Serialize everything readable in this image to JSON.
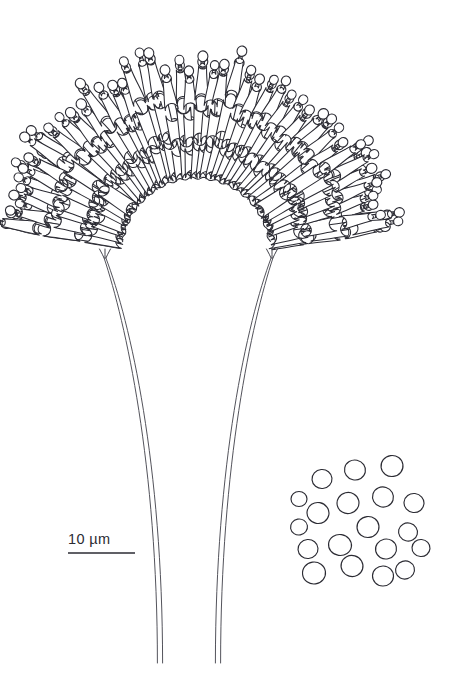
{
  "figure": {
    "kind": "scientific-line-drawing",
    "background_color": "#ffffff",
    "ink_color": "#2b2b33",
    "width": 452,
    "height": 694
  },
  "scalebar": {
    "label": "10 µm",
    "value": 10,
    "unit": "µm",
    "bar_x1": 68,
    "bar_x2": 135,
    "bar_y": 553,
    "label_x": 68,
    "label_y": 531
  },
  "chart_data": {
    "type": "scatter",
    "title": "",
    "xlabel": "",
    "ylabel": "",
    "groups": [
      {
        "name": "conidiophore-head",
        "description": "radiating fan of phialide cells forming an arch",
        "phialide_count": 96,
        "arch_center_x": 196,
        "arch_center_y": 252,
        "inner_radius": 74,
        "outer_radius": 196,
        "angle_start_deg": 188,
        "angle_end_deg": 352
      },
      {
        "name": "stipes",
        "description": "two long tubular stalks descending from the head",
        "count": 2,
        "left_top_x": 105,
        "right_top_x": 272,
        "base_y": 258,
        "tip_y": 663,
        "left_tip_x": 160,
        "right_tip_x": 218,
        "tube_width": 5
      },
      {
        "name": "free-conidia-cluster",
        "description": "detached spores drawn at lower right",
        "count": 19,
        "spores": [
          {
            "cx": 392,
            "cy": 466,
            "rx": 11,
            "ry": 10.5,
            "rot": -8
          },
          {
            "cx": 355,
            "cy": 470,
            "rx": 10.5,
            "ry": 10,
            "rot": 12
          },
          {
            "cx": 322,
            "cy": 479,
            "rx": 10,
            "ry": 9.5,
            "rot": -5
          },
          {
            "cx": 383,
            "cy": 497,
            "rx": 10.5,
            "ry": 10,
            "rot": 18
          },
          {
            "cx": 348,
            "cy": 503,
            "rx": 11,
            "ry": 10.5,
            "rot": -14
          },
          {
            "cx": 414,
            "cy": 503,
            "rx": 10,
            "ry": 9.5,
            "rot": 6
          },
          {
            "cx": 299,
            "cy": 499,
            "rx": 8,
            "ry": 7.5,
            "rot": 0
          },
          {
            "cx": 318,
            "cy": 513,
            "rx": 11,
            "ry": 10.5,
            "rot": 10
          },
          {
            "cx": 299,
            "cy": 527,
            "rx": 8.5,
            "ry": 8,
            "rot": -10
          },
          {
            "cx": 368,
            "cy": 527,
            "rx": 11,
            "ry": 10.5,
            "rot": -6
          },
          {
            "cx": 408,
            "cy": 532,
            "rx": 9.5,
            "ry": 9,
            "rot": 14
          },
          {
            "cx": 340,
            "cy": 545,
            "rx": 11.5,
            "ry": 10.5,
            "rot": 8
          },
          {
            "cx": 386,
            "cy": 549,
            "rx": 10.5,
            "ry": 10,
            "rot": -12
          },
          {
            "cx": 421,
            "cy": 548,
            "rx": 9,
            "ry": 8.5,
            "rot": 4
          },
          {
            "cx": 308,
            "cy": 549,
            "rx": 10,
            "ry": 9.5,
            "rot": -4
          },
          {
            "cx": 352,
            "cy": 566,
            "rx": 11,
            "ry": 10.5,
            "rot": 16
          },
          {
            "cx": 314,
            "cy": 573,
            "rx": 11.5,
            "ry": 11,
            "rot": -8
          },
          {
            "cx": 383,
            "cy": 576,
            "rx": 10.5,
            "ry": 10,
            "rot": 2
          },
          {
            "cx": 405,
            "cy": 570,
            "rx": 9.5,
            "ry": 9,
            "rot": -16
          }
        ]
      }
    ]
  }
}
